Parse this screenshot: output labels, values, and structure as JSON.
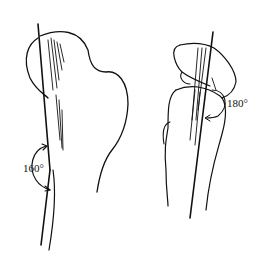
{
  "figure": {
    "left_view": {
      "angle_label": "160°"
    },
    "right_view": {
      "angle_label": "180°"
    },
    "stroke_color": "#111111",
    "background": "#ffffff"
  }
}
